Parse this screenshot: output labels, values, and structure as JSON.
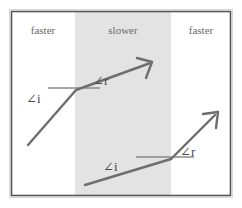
{
  "figure": {
    "colors": {
      "background": "#ffffff",
      "frame_border": "#555555",
      "frame_fill": "#ffffff",
      "slow_band": "#e3e3e3",
      "ray": "#6e6e6e",
      "normal_line": "#8a8a8a",
      "region_label_text": "#6b6b6b",
      "angle_label_text": "#4a4a4a"
    },
    "frame": {
      "x": 11,
      "y": 11,
      "width": 220,
      "height": 185
    },
    "band": {
      "x": 75,
      "y": 12,
      "width": 96,
      "height": 183
    },
    "regions": [
      {
        "name": "left-region",
        "label": "faster",
        "cx": 43,
        "cy": 30
      },
      {
        "name": "middle-region",
        "label": "slower",
        "cx": 123,
        "cy": 30
      },
      {
        "name": "right-region",
        "label": "faster",
        "cx": 201,
        "cy": 30
      }
    ],
    "rays": [
      {
        "name": "upper-ray",
        "incident": {
          "x1": 28,
          "y1": 145,
          "x2": 76,
          "y2": 90
        },
        "refracted": {
          "x1": 76,
          "y1": 90,
          "x2": 150,
          "y2": 63
        },
        "normal": {
          "x1": 48,
          "y1": 88,
          "x2": 100,
          "y2": 88
        },
        "arrow_tip": {
          "x": 152,
          "y": 62
        },
        "angle_incidence_label": {
          "text": "∠i",
          "x": 26,
          "y": 99
        },
        "angle_refraction_label": {
          "text": "∠r",
          "x": 93,
          "y": 81
        }
      },
      {
        "name": "lower-ray",
        "incident": {
          "x1": 85,
          "y1": 185,
          "x2": 171,
          "y2": 159
        },
        "refracted": {
          "x1": 171,
          "y1": 159,
          "x2": 216,
          "y2": 114
        },
        "normal": {
          "x1": 136,
          "y1": 157,
          "x2": 194,
          "y2": 157
        },
        "arrow_tip": {
          "x": 218,
          "y": 112
        },
        "angle_incidence_label": {
          "text": "∠i",
          "x": 103,
          "y": 167
        },
        "angle_refraction_label": {
          "text": "∠r",
          "x": 180,
          "y": 152
        }
      }
    ]
  }
}
